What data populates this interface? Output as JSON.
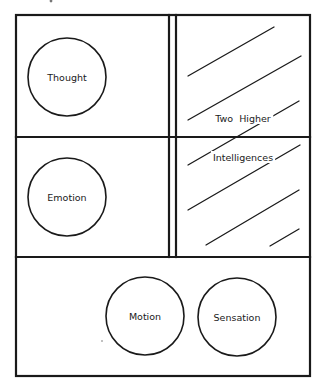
{
  "diagram": {
    "type": "centres-of-being-diagram",
    "colors": {
      "ink": "#1a1a1a",
      "paper": "#ffffff"
    },
    "frame": {
      "outer": {
        "x1": 16,
        "y1": 15,
        "x2": 310,
        "y2": 376
      },
      "double_vertical": {
        "x_left": 169,
        "x_right": 176,
        "y_top": 15,
        "y_bottom": 257
      },
      "horizontal_dividers": [
        137,
        257
      ]
    },
    "circles": [
      {
        "id": "thought",
        "label": "Thought",
        "cx": 67,
        "cy": 77,
        "r": 39
      },
      {
        "id": "emotion",
        "label": "Emotion",
        "cx": 67,
        "cy": 197,
        "r": 39
      },
      {
        "id": "motion",
        "label": "Motion",
        "cx": 145,
        "cy": 316,
        "r": 39
      },
      {
        "id": "sensation",
        "label": "Sensation",
        "cx": 237,
        "cy": 317,
        "r": 39
      }
    ],
    "hatch_lines": [
      {
        "x1": 188,
        "y1": 76,
        "x2": 274,
        "y2": 27
      },
      {
        "x1": 188,
        "y1": 120,
        "x2": 301,
        "y2": 56
      },
      {
        "x1": 188,
        "y1": 165,
        "x2": 299,
        "y2": 101
      },
      {
        "x1": 188,
        "y1": 210,
        "x2": 300,
        "y2": 145
      },
      {
        "x1": 206,
        "y1": 245,
        "x2": 299,
        "y2": 190
      },
      {
        "x1": 270,
        "y1": 246,
        "x2": 299,
        "y2": 229
      }
    ],
    "higher_centres_label": {
      "line1": "Two  Higher",
      "line2": "Intelligences",
      "line1_pos": {
        "x": 243,
        "y": 118
      },
      "line2_pos": {
        "x": 243,
        "y": 157
      }
    }
  }
}
